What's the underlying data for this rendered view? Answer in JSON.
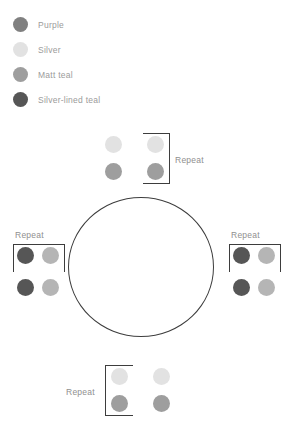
{
  "legend": {
    "items": [
      {
        "label": "Purple",
        "color": "#808080",
        "swatch_name": "legend-swatch-purple"
      },
      {
        "label": "Silver",
        "color": "#e2e2e2",
        "swatch_name": "legend-swatch-silver"
      },
      {
        "label": "Matt teal",
        "color": "#9e9e9e",
        "swatch_name": "legend-swatch-matt-teal"
      },
      {
        "label": "Silver-lined teal",
        "color": "#565656",
        "swatch_name": "legend-swatch-silver-lined-teal"
      }
    ]
  },
  "ring": {
    "outline_color": "#3d3d3d",
    "center_x": 141,
    "center_y": 267,
    "radius_x": 73,
    "radius_y": 70
  },
  "repeat_label": "Repeat",
  "clusters": {
    "top": {
      "name": "bead-cluster-top",
      "repeat_label": "Repeat",
      "beads": [
        {
          "color": "#e2e2e2",
          "bead_name": "bead-silver"
        },
        {
          "color": "#e2e2e2",
          "bead_name": "bead-silver"
        },
        {
          "color": "#9e9e9e",
          "bead_name": "bead-matt-teal"
        },
        {
          "color": "#9e9e9e",
          "bead_name": "bead-matt-teal"
        }
      ]
    },
    "left": {
      "name": "bead-cluster-left",
      "repeat_label": "Repeat",
      "beads": [
        {
          "color": "#565656",
          "bead_name": "bead-silver-lined-teal"
        },
        {
          "color": "#b5b5b5",
          "bead_name": "bead-matt-teal"
        },
        {
          "color": "#565656",
          "bead_name": "bead-silver-lined-teal"
        },
        {
          "color": "#b5b5b5",
          "bead_name": "bead-matt-teal"
        }
      ]
    },
    "right": {
      "name": "bead-cluster-right",
      "repeat_label": "Repeat",
      "beads": [
        {
          "color": "#565656",
          "bead_name": "bead-silver-lined-teal"
        },
        {
          "color": "#b5b5b5",
          "bead_name": "bead-matt-teal"
        },
        {
          "color": "#565656",
          "bead_name": "bead-silver-lined-teal"
        },
        {
          "color": "#b5b5b5",
          "bead_name": "bead-matt-teal"
        }
      ]
    },
    "bottom": {
      "name": "bead-cluster-bottom",
      "repeat_label": "Repeat",
      "beads": [
        {
          "color": "#e2e2e2",
          "bead_name": "bead-silver"
        },
        {
          "color": "#e2e2e2",
          "bead_name": "bead-silver"
        },
        {
          "color": "#9e9e9e",
          "bead_name": "bead-matt-teal"
        },
        {
          "color": "#9e9e9e",
          "bead_name": "bead-matt-teal"
        }
      ]
    }
  }
}
